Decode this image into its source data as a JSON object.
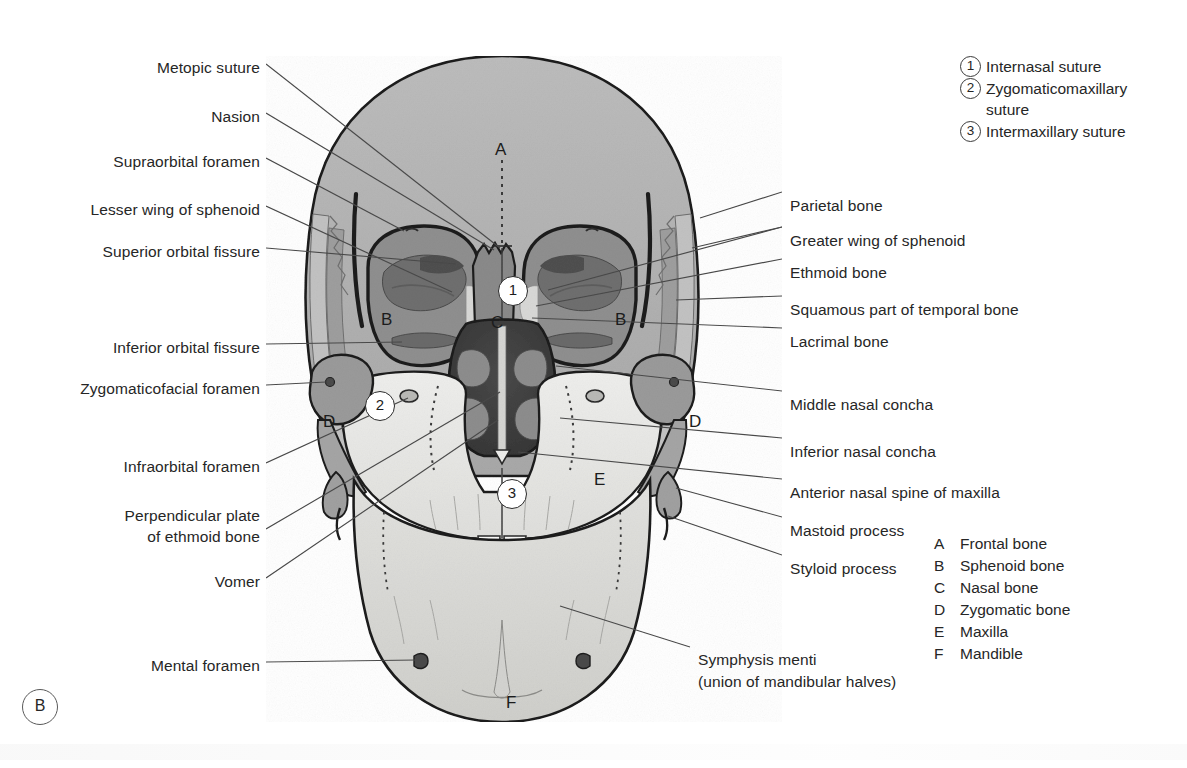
{
  "figure": {
    "panel_letter": "B",
    "caption_mark": "B"
  },
  "labels_left": [
    {
      "text": "Metopic suture",
      "x": 138,
      "y": 58,
      "w": 122
    },
    {
      "text": "Nasion",
      "x": 196,
      "y": 107,
      "w": 64
    },
    {
      "text": "Supraorbital foramen",
      "x": 92,
      "y": 152,
      "w": 168
    },
    {
      "text": "Lesser wing of sphenoid",
      "x": 66,
      "y": 200,
      "w": 194
    },
    {
      "text": "Superior orbital fissure",
      "x": 82,
      "y": 242,
      "w": 178
    },
    {
      "text": "Inferior orbital fissure",
      "x": 90,
      "y": 338,
      "w": 170
    },
    {
      "text": "Zygomaticofacial foramen",
      "x": 26,
      "y": 379,
      "w": 234
    },
    {
      "text": "Infraorbital foramen",
      "x": 104,
      "y": 457,
      "w": 156
    },
    {
      "text": "Perpendicular plate",
      "x": 105,
      "y": 506,
      "w": 155
    },
    {
      "text": "of ethmoid bone",
      "x": 125,
      "y": 527,
      "w": 135
    },
    {
      "text": "Vomer",
      "x": 200,
      "y": 572,
      "w": 60
    },
    {
      "text": "Mental foramen",
      "x": 138,
      "y": 656,
      "w": 122
    }
  ],
  "labels_right": [
    {
      "text": "Parietal bone",
      "x": 790,
      "y": 196
    },
    {
      "text": "Greater wing of sphenoid",
      "x": 790,
      "y": 231
    },
    {
      "text": "Ethmoid bone",
      "x": 790,
      "y": 263
    },
    {
      "text": "Squamous part of temporal bone",
      "x": 790,
      "y": 300
    },
    {
      "text": "Lacrimal bone",
      "x": 790,
      "y": 332
    },
    {
      "text": "Middle nasal concha",
      "x": 790,
      "y": 395
    },
    {
      "text": "Inferior nasal concha",
      "x": 790,
      "y": 442
    },
    {
      "text": "Anterior nasal spine of maxilla",
      "x": 790,
      "y": 483
    },
    {
      "text": "Mastoid process",
      "x": 790,
      "y": 521
    },
    {
      "text": "Styloid process",
      "x": 790,
      "y": 559
    }
  ],
  "labels_bottom": [
    {
      "text": "Symphysis menti",
      "x": 698,
      "y": 650
    },
    {
      "text": "(union of mandibular halves)",
      "x": 698,
      "y": 672
    }
  ],
  "numbered_key": {
    "x": 960,
    "y": 56,
    "items": [
      {
        "num": "1",
        "lines": [
          "Internasal suture"
        ]
      },
      {
        "num": "2",
        "lines": [
          "Zygomaticomaxillary",
          "suture"
        ]
      },
      {
        "num": "3",
        "lines": [
          "Intermaxillary suture"
        ]
      }
    ]
  },
  "letter_key": {
    "x": 934,
    "y": 533,
    "items": [
      {
        "letter": "A",
        "text": "Frontal bone"
      },
      {
        "letter": "B",
        "text": "Sphenoid bone"
      },
      {
        "letter": "C",
        "text": "Nasal bone"
      },
      {
        "letter": "D",
        "text": "Zygomatic bone"
      },
      {
        "letter": "E",
        "text": "Maxilla"
      },
      {
        "letter": "F",
        "text": "Mandible"
      }
    ]
  },
  "skull_letters": [
    {
      "letter": "A",
      "x": 495,
      "y": 140
    },
    {
      "letter": "B",
      "x": 381,
      "y": 310
    },
    {
      "letter": "B",
      "x": 615,
      "y": 310
    },
    {
      "letter": "C",
      "x": 491,
      "y": 313
    },
    {
      "letter": "D",
      "x": 323,
      "y": 412
    },
    {
      "letter": "D",
      "x": 689,
      "y": 412
    },
    {
      "letter": "E",
      "x": 594,
      "y": 470
    },
    {
      "letter": "F",
      "x": 506,
      "y": 693
    }
  ],
  "skull_markers": [
    {
      "num": "1",
      "x": 498,
      "y": 276
    },
    {
      "num": "2",
      "x": 365,
      "y": 391
    },
    {
      "num": "3",
      "x": 497,
      "y": 479
    }
  ],
  "colors": {
    "frontal_bone": "#b2b2b2",
    "parietal_strip": "#a3a3a3",
    "sphenoid_orbit": "#8f8f8f",
    "nasal_bone": "#8a8a8a",
    "nasal_cavity": "#3f3f3f",
    "concha": "#8d8d8d",
    "maxilla": "#e8e8e6",
    "mandible": "#dcdcda",
    "zygomatic": "#9a9a9a",
    "teeth": "#fbfbfa",
    "outline": "#1e1e1e",
    "leader": "#4a4a4a",
    "text": "#262626"
  }
}
